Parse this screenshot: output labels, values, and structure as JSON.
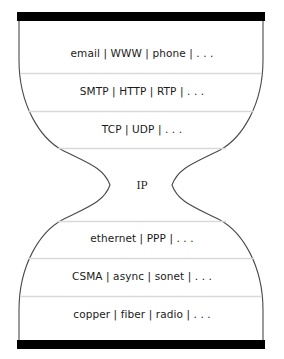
{
  "diagram": {
    "name": "ip-hourglass",
    "colors": {
      "bar": "#000000",
      "outline": "#4a4a4a",
      "divider": "#d9d9d9",
      "background": "#ffffff",
      "text": "#1a1a1a"
    },
    "top_bar": {
      "label": ""
    },
    "bottom_bar": {
      "label": ""
    },
    "layers": [
      {
        "id": "applications",
        "label": "email | WWW | phone | . . ."
      },
      {
        "id": "application-protocols",
        "label": "SMTP | HTTP | RTP | . . ."
      },
      {
        "id": "transport",
        "label": "TCP | UDP | . . ."
      },
      {
        "id": "network",
        "label": "IP"
      },
      {
        "id": "data-link",
        "label": "ethernet | PPP | . . ."
      },
      {
        "id": "mac-framing",
        "label": "CSMA | async | sonet | . . ."
      },
      {
        "id": "physical",
        "label": "copper | fiber | radio | . . ."
      }
    ]
  }
}
